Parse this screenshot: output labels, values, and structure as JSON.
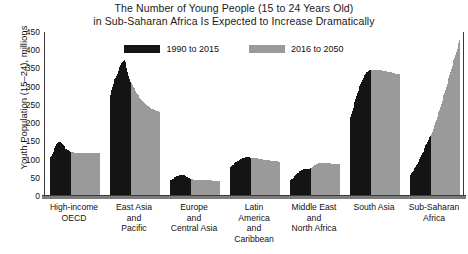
{
  "chart_data": {
    "type": "bar",
    "title": "The Number of Young People (15 to 24 Years Old) in Sub-Saharan Africa Is Expected to Increase Dramatically",
    "title_lines": [
      "The Number of Young People (15 to 24 Years Old)",
      "in Sub-Saharan Africa Is Expected to Increase Dramatically"
    ],
    "xlabel": "",
    "ylabel": "Youth Population (15–24), millions",
    "ylim": [
      0,
      450
    ],
    "yticks": [
      0,
      50,
      100,
      150,
      200,
      250,
      300,
      350,
      400,
      450
    ],
    "ytick_labels": [
      "0",
      "50",
      "100",
      "150",
      "200",
      "250",
      "300",
      "350",
      "400",
      "450"
    ],
    "grid": false,
    "legend_position": "top-center",
    "legend": [
      {
        "name": "1990 to 2015",
        "color": "#141414"
      },
      {
        "name": "2016 to 2050",
        "color": "#9a9a9a"
      }
    ],
    "categories": [
      "High-income OECD",
      "East Asia and Pacific",
      "Europe and Central Asia",
      "Latin America and Caribbean",
      "Middle East and North Africa",
      "South Asia",
      "Sub-Saharan Africa"
    ],
    "category_label_lines": [
      [
        "High-income",
        "OECD"
      ],
      [
        "East Asia",
        "and",
        "Pacific"
      ],
      [
        "Europe",
        "and",
        "Central Asia"
      ],
      [
        "Latin",
        "America",
        "and",
        "Caribbean"
      ],
      [
        "Middle East",
        "and",
        "North Africa"
      ],
      [
        "South Asia"
      ],
      [
        "Sub-Saharan",
        "Africa"
      ]
    ],
    "groups": [
      {
        "category": "High-income OECD",
        "historical": [
          103,
          106,
          110,
          116,
          122,
          128,
          133,
          138,
          142,
          145,
          147,
          148,
          148,
          147,
          145,
          142,
          139,
          136,
          133,
          130,
          128,
          126,
          125,
          124,
          123,
          122
        ],
        "projected": [
          121,
          120,
          120,
          119,
          119,
          119,
          119,
          119,
          119,
          119,
          119,
          119,
          119,
          119,
          119,
          119,
          119,
          119,
          119,
          119,
          119,
          119,
          119,
          119,
          119,
          119,
          119,
          119,
          119,
          119,
          119,
          119,
          119,
          119,
          119
        ]
      },
      {
        "category": "East Asia and Pacific",
        "historical": [
          266,
          278,
          290,
          300,
          308,
          315,
          320,
          325,
          330,
          336,
          342,
          348,
          355,
          360,
          365,
          368,
          370,
          368,
          372,
          368,
          352,
          340,
          330,
          322,
          316,
          312
        ],
        "projected": [
          310,
          305,
          300,
          296,
          292,
          288,
          284,
          280,
          276,
          272,
          269,
          266,
          263,
          260,
          258,
          256,
          254,
          252,
          250,
          248,
          246,
          244,
          243,
          241,
          240,
          239,
          238,
          237,
          236,
          235,
          234,
          233,
          232,
          231,
          230
        ]
      },
      {
        "category": "Europe and Central Asia",
        "historical": [
          43,
          44,
          45,
          47,
          48,
          50,
          51,
          53,
          54,
          55,
          56,
          57,
          58,
          59,
          59,
          59,
          58,
          57,
          56,
          54,
          52,
          51,
          50,
          49,
          48,
          47
        ],
        "projected": [
          46,
          46,
          45,
          45,
          45,
          45,
          45,
          45,
          45,
          45,
          45,
          45,
          44,
          44,
          44,
          44,
          44,
          44,
          44,
          43,
          43,
          43,
          43,
          43,
          43,
          42,
          42,
          42,
          42,
          42,
          42,
          41,
          41,
          41,
          41
        ]
      },
      {
        "category": "Latin America and Caribbean",
        "historical": [
          78,
          80,
          82,
          84,
          86,
          88,
          90,
          92,
          94,
          96,
          97,
          99,
          100,
          101,
          102,
          103,
          104,
          105,
          105,
          106,
          106,
          106,
          106,
          106,
          105,
          105
        ],
        "projected": [
          105,
          105,
          104,
          104,
          104,
          103,
          103,
          103,
          102,
          102,
          102,
          101,
          101,
          101,
          100,
          100,
          100,
          99,
          99,
          99,
          98,
          98,
          98,
          97,
          97,
          97,
          96,
          96,
          96,
          95,
          95,
          95,
          94,
          94,
          94
        ]
      },
      {
        "category": "Middle East and North Africa",
        "historical": [
          42,
          44,
          46,
          48,
          50,
          53,
          55,
          58,
          60,
          62,
          64,
          66,
          68,
          70,
          71,
          72,
          73,
          74,
          75,
          75,
          75,
          75,
          75,
          75,
          75,
          76
        ],
        "projected": [
          78,
          80,
          82,
          84,
          85,
          86,
          87,
          88,
          89,
          90,
          90,
          91,
          91,
          91,
          91,
          91,
          91,
          91,
          90,
          90,
          90,
          90,
          90,
          90,
          89,
          89,
          89,
          89,
          89,
          88,
          88,
          88,
          88,
          88,
          88
        ]
      },
      {
        "category": "South Asia",
        "historical": [
          210,
          218,
          226,
          234,
          242,
          250,
          258,
          266,
          274,
          282,
          289,
          296,
          302,
          308,
          314,
          319,
          324,
          328,
          332,
          336,
          339,
          341,
          343,
          344,
          345,
          346
        ],
        "projected": [
          346,
          346,
          347,
          347,
          347,
          347,
          347,
          347,
          346,
          346,
          346,
          345,
          345,
          344,
          344,
          343,
          343,
          342,
          342,
          341,
          341,
          340,
          340,
          339,
          339,
          338,
          338,
          337,
          337,
          336,
          336,
          335,
          335,
          334,
          334
        ]
      },
      {
        "category": "Sub-Saharan Africa",
        "historical": [
          56,
          59,
          62,
          65,
          68,
          72,
          76,
          80,
          84,
          88,
          93,
          97,
          102,
          107,
          112,
          117,
          122,
          128,
          133,
          139,
          144,
          149,
          154,
          158,
          162,
          166
        ],
        "projected": [
          171,
          177,
          183,
          189,
          196,
          202,
          209,
          216,
          223,
          230,
          237,
          245,
          252,
          260,
          268,
          276,
          284,
          292,
          300,
          308,
          316,
          324,
          332,
          340,
          348,
          356,
          364,
          372,
          380,
          388,
          396,
          404,
          412,
          420,
          428
        ]
      }
    ]
  },
  "colors": {
    "historical": "#141414",
    "projected": "#9a9a9a",
    "axis": "#3a3a3a",
    "baseline": "#7c7c7c",
    "background": "#ffffff"
  }
}
